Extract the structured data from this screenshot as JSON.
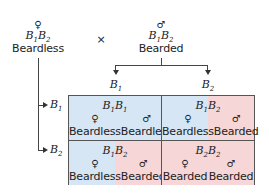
{
  "parents": {
    "female": {
      "symbol": "♀",
      "genotype": [
        "B",
        "1",
        "B",
        "2"
      ],
      "phenotype": "Beardless"
    },
    "cross_symbol": "×",
    "male": {
      "symbol": "♂",
      "genotype": [
        "B",
        "1",
        "B",
        "2"
      ],
      "phenotype": "Bearded"
    }
  },
  "male_gametes": [
    {
      "allele": "B",
      "sub": "1"
    },
    {
      "allele": "B",
      "sub": "2"
    }
  ],
  "female_gametes": [
    {
      "allele": "B",
      "sub": "1"
    },
    {
      "allele": "B",
      "sub": "2"
    }
  ],
  "grid": [
    [
      {
        "genotype": [
          "B",
          "1",
          "B",
          "1"
        ],
        "female_symbol": "♀",
        "female_pheno": "Beardless",
        "male_symbol": "♂",
        "male_pheno": "Beardless"
      },
      {
        "genotype": [
          "B",
          "1",
          "B",
          "2"
        ],
        "female_symbol": "♀",
        "female_pheno": "Beardless",
        "male_symbol": "♂",
        "male_pheno": "Bearded"
      }
    ],
    [
      {
        "genotype": [
          "B",
          "1",
          "B",
          "2"
        ],
        "female_symbol": "♀",
        "female_pheno": "Beardless",
        "male_symbol": "♂",
        "male_pheno": "Bearded"
      },
      {
        "genotype": [
          "B",
          "2",
          "B",
          "2"
        ],
        "female_symbol": "♀",
        "female_pheno": "Bearded",
        "male_symbol": "♂",
        "male_pheno": "Bearded"
      }
    ]
  ],
  "colors": {
    "beardless": "#d6e6f5",
    "bearded": "#f6d6d6",
    "line": "#444444"
  }
}
